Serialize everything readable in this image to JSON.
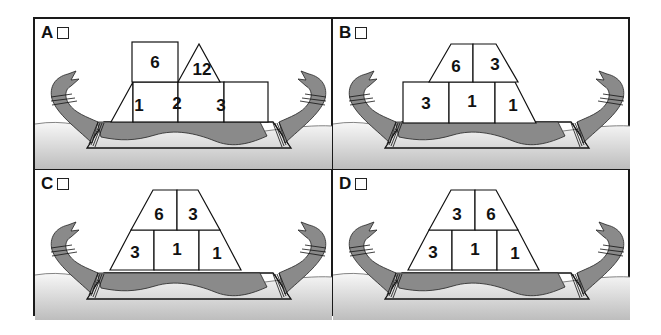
{
  "figure": {
    "colors": {
      "hull": "#8a8a8a",
      "water_top": "#f2f2f2",
      "water_bottom": "#c4c4c4",
      "outline": "#111111",
      "block_fill": "#ffffff"
    }
  },
  "panels": [
    {
      "id": "A",
      "label": "A",
      "layout": "A",
      "blocks": {
        "bottom_left": "1",
        "bottom_middle": "2",
        "bottom_right": "3",
        "top_square": "6",
        "top_triangle": "12"
      }
    },
    {
      "id": "B",
      "label": "B",
      "layout": "B",
      "blocks": {
        "bottom_left": "3",
        "bottom_middle": "1",
        "bottom_right": "1",
        "top_left": "6",
        "top_right": "3"
      }
    },
    {
      "id": "C",
      "label": "C",
      "layout": "C",
      "blocks": {
        "bottom_left": "3",
        "bottom_middle": "1",
        "bottom_right": "1",
        "top_left": "6",
        "top_right": "3"
      }
    },
    {
      "id": "D",
      "label": "D",
      "layout": "C",
      "blocks": {
        "bottom_left": "3",
        "bottom_middle": "1",
        "bottom_right": "1",
        "top_left": "3",
        "top_right": "6"
      }
    }
  ]
}
